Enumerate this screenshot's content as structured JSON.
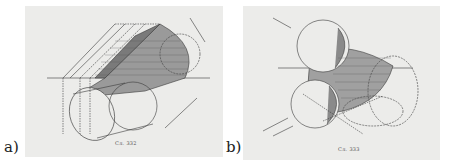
{
  "figure": {
    "panels": [
      {
        "id": "a",
        "label": "a)",
        "caption": "Сл. 332",
        "subject": "oblique cylinder projection with shaded shadow region and ground line x–y"
      },
      {
        "id": "b",
        "label": "b)",
        "caption": "Сл. 333",
        "subject": "two spheres joined by shaded cylindrical surface with construction ellipses and ground line x–y"
      }
    ],
    "colors": {
      "paper": "#ececea",
      "ink": "#3a3a3a",
      "shade": "#8a8a8a",
      "background": "#ffffff"
    }
  }
}
